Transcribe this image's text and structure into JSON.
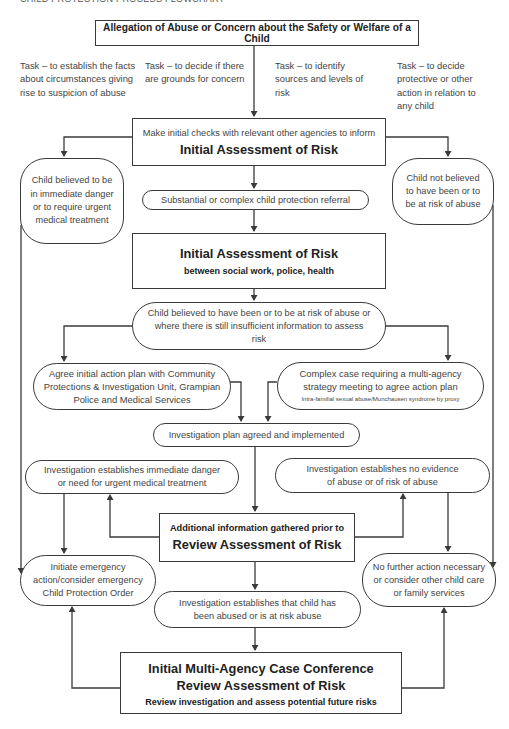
{
  "header": {
    "title": "CHILD PROTECTION PROCESS FLOWCHART"
  },
  "nodes": {
    "allegation": "Allegation of Abuse or Concern about the Safety or Welfare of a Child",
    "tasks": [
      "Task – to establish the facts about circumstances giving rise to suspicion of abuse",
      "Task – to decide if there are grounds for concern",
      "Task – to identify sources and levels of risk",
      "Task – to decide protective or other action in relation to any child"
    ],
    "initial_checks": {
      "line1": "Make initial checks with relevant other agencies to inform",
      "line2": "Initial Assessment of Risk"
    },
    "child_immediate_danger": "Child believed to be in immediate danger or to require urgent medical treatment",
    "child_not_at_risk": "Child not believed to have been or to be at risk of abuse",
    "substantial_referral": "Substantial or complex child protection referral",
    "initial_assessment": {
      "title": "Initial Assessment of Risk",
      "subtitle": "between social work, police, health"
    },
    "child_at_risk": "Child believed to have been or to be at risk of abuse or where there is still insufficient information to assess risk",
    "agree_plan": "Agree initial action plan with Community Protections & Investigation Unit, Grampian Police and Medical Services",
    "complex_case": {
      "main": "Complex case requiring a multi-agency strategy meeting to agree action plan",
      "note": "Intra-familial sexual abuse/Munchausen syndrome by proxy"
    },
    "investigation_plan": "Investigation plan agreed and implemented",
    "inv_immediate_danger": "Investigation establishes immediate danger or need for urgent medical treatment",
    "inv_no_evidence": "Investigation establishes no evidence of abuse or of risk of abuse",
    "additional_info": {
      "line1": "Additional information gathered prior to",
      "line2": "Review Assessment of Risk"
    },
    "emergency_action": "Initiate emergency action/consider emergency Child Protection Order",
    "no_further_action": "No further action necessary or consider other child care or family services",
    "inv_abused": "Investigation establishes that child has been abused or is at risk abuse",
    "case_conference": {
      "title": "Initial Multi-Agency Case Conference Review Assessment of Risk",
      "subtitle": "Review investigation and assess potential future risks"
    }
  },
  "colors": {
    "line": "#3a3a3a",
    "text": "#444444",
    "background": "#ffffff"
  }
}
